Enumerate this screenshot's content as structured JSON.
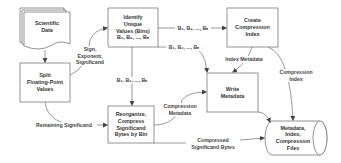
{
  "nodes": {
    "scientific_data": {
      "label": "Scientific\nData",
      "shape": "stacked-document"
    },
    "split": {
      "label": "Split\nFloating-Point\nValues",
      "shape": "rectangle"
    },
    "identify": {
      "label": "Identify\nUnique\nValues (Bins)\nB₁, B₂, ..., Bₙ",
      "shape": "rectangle"
    },
    "create_index": {
      "label": "Create\nCompression\nIndex",
      "shape": "rectangle"
    },
    "write_metadata": {
      "label": "Write\nMetadata",
      "shape": "rectangle"
    },
    "reorganize": {
      "label": "Reorganize,\nCompress\nSignificand\nBytes by Bin",
      "shape": "rectangle"
    },
    "storage": {
      "label": "Metadata,\nIndex,\nCompression\nFiles",
      "shape": "cylinder"
    }
  },
  "edges": {
    "data_to_split": {
      "label": ""
    },
    "split_to_identify": {
      "label": "Sign,\nExponent,\nSignificand"
    },
    "identify_to_index": {
      "label": "B₁, B₂, ..., Bₙ"
    },
    "identify_to_write": {
      "label": "B₁, B₂, ..., Bₙ"
    },
    "identify_to_reorganize": {
      "label": "B₁, B₂, ..., Bₙ"
    },
    "index_to_write": {
      "label": "Index Metadata"
    },
    "index_to_storage": {
      "label": "Compression\nIndex"
    },
    "split_to_reorganize": {
      "label": "Remaining Significand"
    },
    "reorganize_to_write": {
      "label": "Compression\nMetadata"
    },
    "write_to_storage": {
      "label": ""
    },
    "reorganize_to_storage": {
      "label": "Compressed\nSignificand Bytes"
    }
  },
  "colors": {
    "stroke": "#555555",
    "text": "#333333",
    "background": "#ffffff"
  }
}
